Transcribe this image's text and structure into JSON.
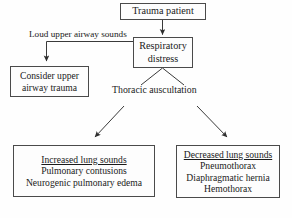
{
  "diagram": {
    "background_color": "#fefefe",
    "line_color": "#3a3a3a",
    "border_color": "#4a4a4a",
    "text_color": "#1a1a1a"
  },
  "nodes": {
    "trauma": {
      "lines": [
        "Trauma patient"
      ]
    },
    "respiratory": {
      "lines": [
        "Respiratory",
        "distress"
      ]
    },
    "consider": {
      "lines": [
        "Consider upper",
        "airway trauma"
      ]
    },
    "increased": {
      "heading": "Increased lung sounds",
      "lines": [
        "Pulmonary contusions",
        "Neurogenic pulmonary edema"
      ]
    },
    "decreased": {
      "heading": "Decreased lung sounds",
      "lines": [
        "Pneumothorax",
        "Diaphragmatic hernia",
        "Hemothorax"
      ]
    }
  },
  "labels": {
    "loud_sounds": "Loud upper airway sounds",
    "thoracic": "Thoracic auscultation"
  },
  "connectors": [
    {
      "name": "trauma-to-respiratory",
      "from": "trauma",
      "to": "respiratory",
      "style": "straight-arrow",
      "direction": "down"
    },
    {
      "name": "respiratory-to-consider",
      "from": "respiratory",
      "to": "consider",
      "style": "elbow-arrow",
      "direction": "left-then-down",
      "label": "Loud upper airway sounds"
    },
    {
      "name": "respiratory-to-auscultation-left",
      "from": "respiratory",
      "to": "thoracic-auscultation",
      "style": "plain-line",
      "direction": "down-left"
    },
    {
      "name": "respiratory-to-auscultation-right",
      "from": "respiratory",
      "to": "thoracic-auscultation",
      "style": "plain-line",
      "direction": "down-right"
    },
    {
      "name": "auscultation-to-increased",
      "from": "thoracic-auscultation",
      "to": "increased",
      "style": "straight-arrow",
      "direction": "down-left"
    },
    {
      "name": "auscultation-to-decreased",
      "from": "thoracic-auscultation",
      "to": "decreased",
      "style": "straight-arrow",
      "direction": "down-right"
    }
  ]
}
